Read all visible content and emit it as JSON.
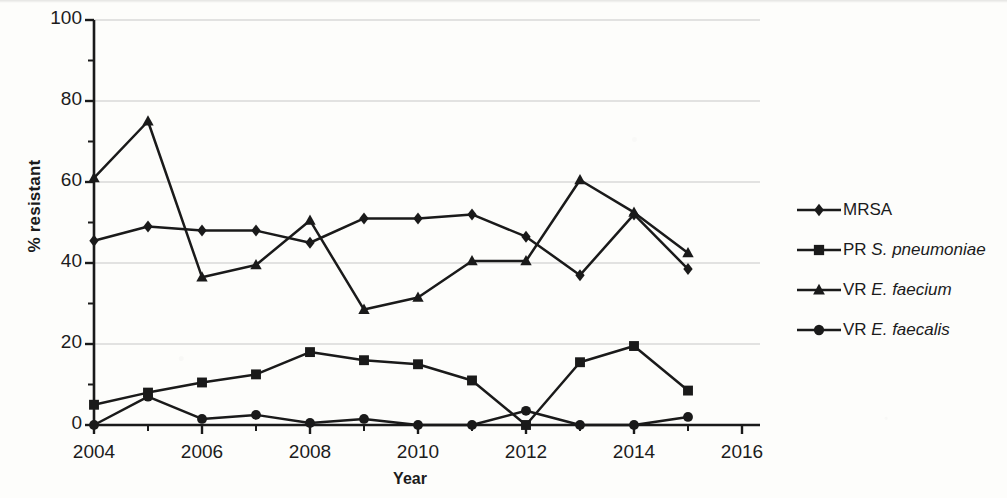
{
  "chart_data": {
    "type": "line",
    "title": "",
    "xlabel": "Year",
    "ylabel": "% resistant",
    "x": [
      2004,
      2005,
      2006,
      2007,
      2008,
      2009,
      2010,
      2011,
      2012,
      2013,
      2014,
      2015
    ],
    "xlim": [
      2004,
      2016
    ],
    "ylim": [
      0,
      100
    ],
    "xticks": [
      2004,
      2006,
      2008,
      2010,
      2012,
      2014,
      2016
    ],
    "xtick_labels": [
      "2004",
      "2006",
      "2008",
      "2010",
      "2012",
      "2014",
      "2016"
    ],
    "yticks": [
      0,
      20,
      40,
      60,
      80,
      100
    ],
    "ytick_labels": [
      "0",
      "20",
      "40",
      "60",
      "80",
      "100"
    ],
    "minor_ytick_step": 10,
    "grid": "horizontal-major",
    "legend_position": "right",
    "line_color": "#1a1a1a",
    "grid_color": "#c8c8c8",
    "series": [
      {
        "name": "MRSA",
        "marker": "diamond",
        "values": [
          45.5,
          49,
          48,
          48,
          45,
          51,
          51,
          52,
          46.5,
          37,
          52,
          38.5
        ]
      },
      {
        "name": "PR S. pneumoniae",
        "name_prefix": "PR ",
        "name_italic": "S. pneumoniae",
        "marker": "square",
        "values": [
          5,
          8,
          10.5,
          12.5,
          18,
          16,
          15,
          11,
          0,
          15.5,
          19.5,
          8.5
        ]
      },
      {
        "name": "VR E. faecium",
        "name_prefix": "VR ",
        "name_italic": "E. faecium",
        "marker": "triangle",
        "values": [
          61,
          75,
          36.5,
          39.5,
          50.5,
          28.5,
          31.5,
          40.5,
          40.5,
          60.5,
          52.5,
          42.5
        ]
      },
      {
        "name": "VR E. faecalis",
        "name_prefix": "VR ",
        "name_italic": "E. faecalis",
        "marker": "circle",
        "values": [
          0,
          7,
          1.5,
          2.5,
          0.5,
          1.5,
          0,
          0,
          3.5,
          0,
          0,
          2
        ]
      }
    ]
  },
  "legend": {
    "items": [
      {
        "label_prefix": "MRSA",
        "label_italic": "",
        "marker": "diamond"
      },
      {
        "label_prefix": "PR ",
        "label_italic": "S. pneumoniae",
        "marker": "square"
      },
      {
        "label_prefix": "VR ",
        "label_italic": "E. faecium",
        "marker": "triangle"
      },
      {
        "label_prefix": "VR ",
        "label_italic": "E. faecalis",
        "marker": "circle"
      }
    ]
  }
}
